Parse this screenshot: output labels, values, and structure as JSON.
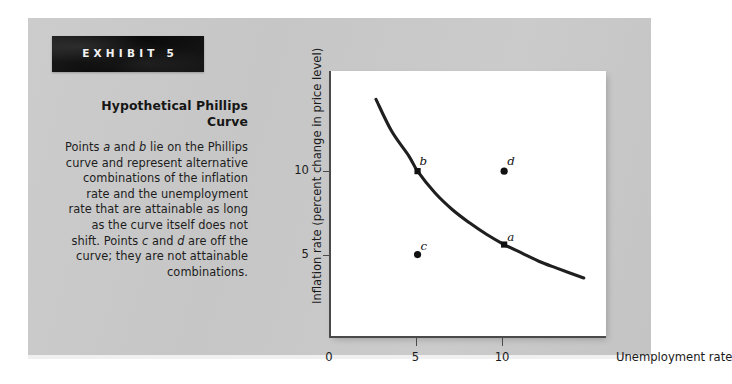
{
  "exhibit": {
    "banner_label": "EXHIBIT 5",
    "title": "Hypothetical Phillips Curve",
    "caption": "Points a and b lie on the Phillips curve and represent alternative combinations of the inflation rate and the unemployment rate that are attainable as long as the curve itself does not shift. Points c and d are off the curve; they are not attainable combinations.",
    "panel_color": "#c9c9c9",
    "banner_color": "#151515"
  },
  "chart_data": {
    "type": "line",
    "title": "Hypothetical Phillips Curve",
    "xlabel": "Unemployment rate",
    "ylabel": "Inflation rate (percent change in price level)",
    "xlim": [
      0,
      16
    ],
    "ylim": [
      0,
      16
    ],
    "xticks": [
      "0",
      "5",
      "10"
    ],
    "xtick_values": [
      0,
      5,
      10
    ],
    "yticks": [
      "5",
      "10"
    ],
    "ytick_values": [
      5,
      10
    ],
    "grid": false,
    "legend": false,
    "curve_color": "#1f1f1f",
    "series": [
      {
        "name": "Phillips curve",
        "x": [
          2.6,
          3.5,
          4.5,
          5.0,
          6.0,
          7.0,
          8.0,
          9.0,
          10.0,
          11.0,
          12.0,
          13.0,
          14.6
        ],
        "y": [
          14.3,
          12.4,
          10.9,
          10.0,
          8.7,
          7.7,
          6.9,
          6.2,
          5.6,
          5.1,
          4.6,
          4.2,
          3.6
        ]
      }
    ],
    "points": [
      {
        "label": "a",
        "x": 10.0,
        "y": 5.6,
        "on_curve": true,
        "marker": "square"
      },
      {
        "label": "b",
        "x": 5.0,
        "y": 10.0,
        "on_curve": true,
        "marker": "square"
      },
      {
        "label": "c",
        "x": 5.0,
        "y": 5.0,
        "on_curve": false,
        "marker": "dot"
      },
      {
        "label": "d",
        "x": 10.0,
        "y": 10.0,
        "on_curve": false,
        "marker": "dot"
      }
    ]
  }
}
